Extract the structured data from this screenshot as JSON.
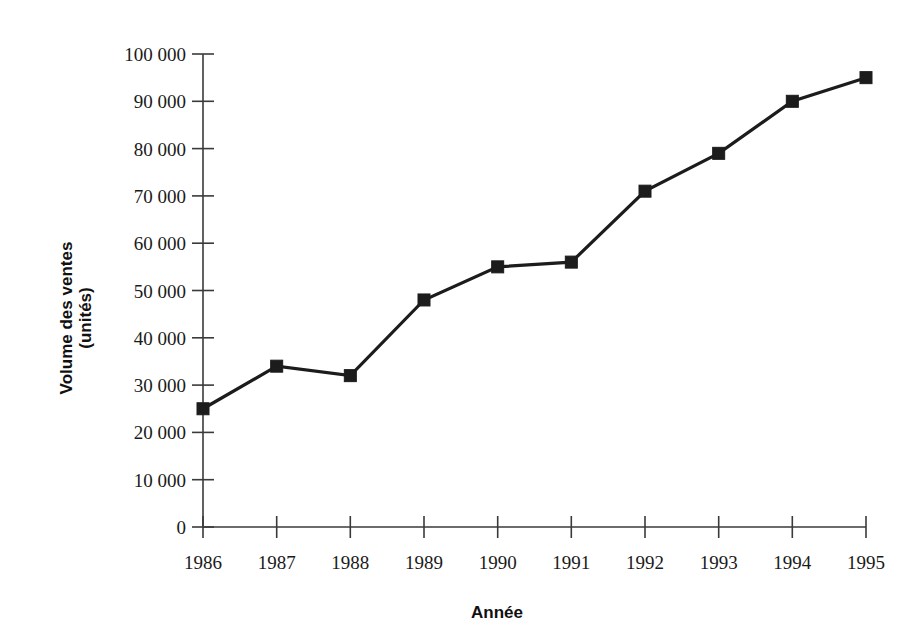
{
  "chart_data": {
    "type": "line",
    "title": "",
    "subtitle": "",
    "xlabel": "Année",
    "ylabel": "Volume des ventes\n(unités)",
    "ylabel_line1": "Volume des ventes",
    "ylabel_line2": "(unités)",
    "categories": [
      "1986",
      "1987",
      "1988",
      "1989",
      "1990",
      "1991",
      "1992",
      "1993",
      "1994",
      "1995"
    ],
    "x": [
      1986,
      1987,
      1988,
      1989,
      1990,
      1991,
      1992,
      1993,
      1994,
      1995
    ],
    "values": [
      25000,
      34000,
      32000,
      48000,
      55000,
      56000,
      71000,
      79000,
      90000,
      95000
    ],
    "series": [
      {
        "name": "Volume des ventes",
        "values": [
          25000,
          34000,
          32000,
          48000,
          55000,
          56000,
          71000,
          79000,
          90000,
          95000
        ],
        "color": "#1c1c1c",
        "marker": "square"
      }
    ],
    "ylim": [
      0,
      100000
    ],
    "xlim": [
      1986,
      1995
    ],
    "yticks": [
      0,
      10000,
      20000,
      30000,
      40000,
      50000,
      60000,
      70000,
      80000,
      90000,
      100000
    ],
    "ytick_labels": [
      "0",
      "10 000",
      "20 000",
      "30 000",
      "40 000",
      "50 000",
      "60 000",
      "70 000",
      "80 000",
      "90 000",
      "100 000"
    ],
    "xtick_labels": [
      "1986",
      "1987",
      "1988",
      "1989",
      "1990",
      "1991",
      "1992",
      "1993",
      "1994",
      "1995"
    ],
    "grid": false,
    "legend": false,
    "legend_position": "none",
    "annotations": []
  },
  "colors": {
    "series": "#1c1c1c",
    "axis": "#3a3a3a",
    "text": "#1a1a1a",
    "background": "#ffffff"
  }
}
